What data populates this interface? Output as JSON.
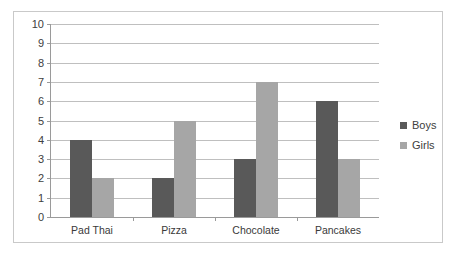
{
  "chart_data": {
    "type": "bar",
    "title": "",
    "subtitle": "",
    "xlabel": "",
    "ylabel": "",
    "categories": [
      "Pad Thai",
      "Pizza",
      "Chocolate",
      "Pancakes"
    ],
    "series": [
      {
        "name": "Boys",
        "color": "#595959",
        "values": [
          4,
          2,
          3,
          6
        ]
      },
      {
        "name": "Girls",
        "color": "#a6a6a6",
        "values": [
          2,
          5,
          7,
          3
        ]
      }
    ],
    "ylim": [
      0,
      10
    ],
    "ytick_step": 1,
    "ytick_labels": [
      "10",
      "9",
      "8",
      "7",
      "6",
      "5",
      "4",
      "3",
      "2",
      "1",
      "0"
    ],
    "grid": true,
    "grid_color": "#bfbfbf",
    "legend_position": "right",
    "axis_color": "#9a9a9a",
    "border_color": "#c9c9c9",
    "background": "#ffffff",
    "text_color": "#404040"
  },
  "legend": {
    "entries": [
      {
        "label": "Boys",
        "color": "#595959"
      },
      {
        "label": "Girls",
        "color": "#a6a6a6"
      }
    ]
  }
}
